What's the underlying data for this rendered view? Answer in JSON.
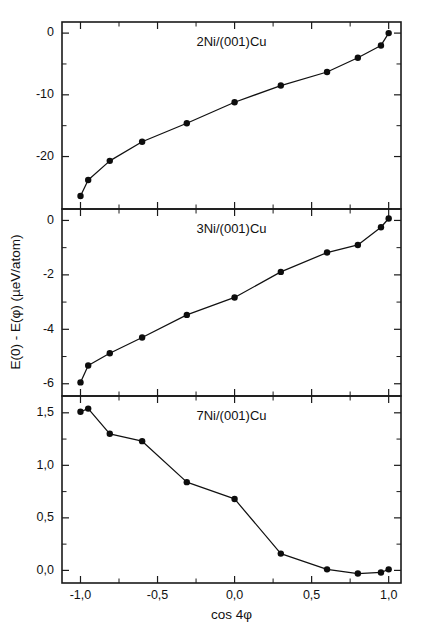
{
  "figure": {
    "xlabel": "cos 4φ",
    "ylabel": "E(0) - E(φ)  (µeV/atom)",
    "background_color": "#ffffff",
    "line_color": "#111111",
    "marker_color": "#0d0d0d"
  },
  "chart_data": [
    {
      "type": "line",
      "title": "2Ni/(001)Cu",
      "panel": "top",
      "xlabel": "cos 4φ",
      "ylabel": "E(0) - E(φ) (µeV/atom)",
      "xlim": [
        -1.12,
        1.08
      ],
      "ylim": [
        -28.5,
        1.8
      ],
      "grid": false,
      "legend": false,
      "x_ticks": [
        -1.0,
        -0.5,
        0.0,
        0.5,
        1.0
      ],
      "x_tick_labels": [
        "-1,0",
        "-0,5",
        "0,0",
        "0,5",
        "1,0"
      ],
      "y_ticks": [
        0,
        -10,
        -20
      ],
      "y_tick_labels": [
        "0",
        "-10",
        "-20"
      ],
      "x": [
        -1.0,
        -0.95,
        -0.81,
        -0.6,
        -0.31,
        0.0,
        0.3,
        0.6,
        0.8,
        0.95,
        1.0
      ],
      "values": [
        -26.4,
        -23.8,
        -20.7,
        -17.6,
        -14.6,
        -11.2,
        -8.5,
        -6.3,
        -4.0,
        -2.0,
        0.0
      ]
    },
    {
      "type": "line",
      "title": "3Ni/(001)Cu",
      "panel": "middle",
      "xlabel": "cos 4φ",
      "ylabel": "E(0) - E(φ) (µeV/atom)",
      "xlim": [
        -1.12,
        1.08
      ],
      "ylim": [
        -6.45,
        0.42
      ],
      "grid": false,
      "legend": false,
      "x_ticks": [
        -1.0,
        -0.5,
        0.0,
        0.5,
        1.0
      ],
      "x_tick_labels": [
        "-1,0",
        "-0,5",
        "0,0",
        "0,5",
        "1,0"
      ],
      "y_ticks": [
        0,
        -2,
        -4,
        -6
      ],
      "y_tick_labels": [
        "0",
        "-2",
        "-4",
        "-6"
      ],
      "x": [
        -1.0,
        -0.95,
        -0.81,
        -0.6,
        -0.31,
        0.0,
        0.3,
        0.6,
        0.8,
        0.95,
        1.0
      ],
      "values": [
        -5.95,
        -5.33,
        -4.88,
        -4.3,
        -3.47,
        -2.83,
        -1.89,
        -1.18,
        -0.9,
        -0.25,
        0.07
      ]
    },
    {
      "type": "line",
      "title": "7Ni/(001)Cu",
      "panel": "bottom",
      "xlabel": "cos 4φ",
      "ylabel": "E(0) - E(φ) (µeV/atom)",
      "xlim": [
        -1.12,
        1.08
      ],
      "ylim": [
        -0.12,
        1.66
      ],
      "grid": false,
      "legend": false,
      "x_ticks": [
        -1.0,
        -0.5,
        0.0,
        0.5,
        1.0
      ],
      "x_tick_labels": [
        "-1,0",
        "-0,5",
        "0,0",
        "0,5",
        "1,0"
      ],
      "y_ticks": [
        1.5,
        1.0,
        0.5,
        0.0
      ],
      "y_tick_labels": [
        "1,5",
        "1,0",
        "0,5",
        "0,0"
      ],
      "x": [
        -1.0,
        -0.95,
        -0.81,
        -0.6,
        -0.31,
        0.0,
        0.3,
        0.6,
        0.8,
        0.95,
        1.0
      ],
      "values": [
        1.51,
        1.54,
        1.3,
        1.23,
        0.84,
        0.68,
        0.16,
        0.01,
        -0.03,
        -0.02,
        0.01
      ]
    }
  ]
}
